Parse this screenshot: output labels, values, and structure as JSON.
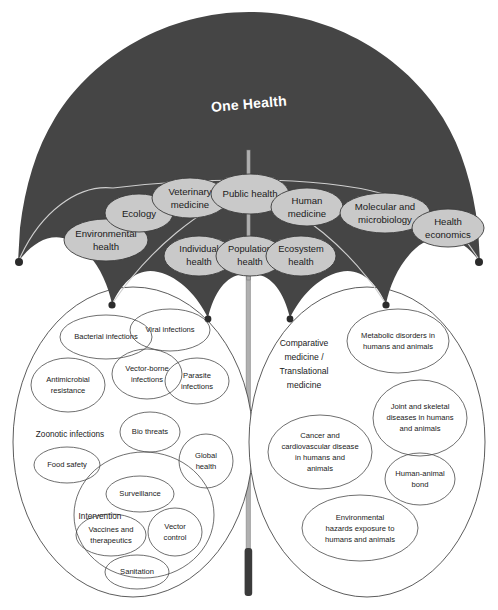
{
  "diagram": {
    "title": "One Health",
    "canopy_color": "#454545",
    "ellipse_color": "#c9c9c9",
    "outline_color": "#4a4a4a"
  },
  "canopy_disciplines": [
    {
      "id": "environmental-health",
      "line1": "Environmental",
      "line2": "health"
    },
    {
      "id": "ecology",
      "line1": "Ecology",
      "line2": ""
    },
    {
      "id": "veterinary-medicine",
      "line1": "Veterinary",
      "line2": "medicine"
    },
    {
      "id": "public-health",
      "line1": "Public health",
      "line2": ""
    },
    {
      "id": "human-medicine",
      "line1": "Human",
      "line2": "medicine"
    },
    {
      "id": "molecular-and-microbiology",
      "line1": "Molecular and",
      "line2": "microbiology"
    },
    {
      "id": "health-economics",
      "line1": "Health",
      "line2": "economics"
    }
  ],
  "core_health_levels": [
    {
      "id": "individual-health",
      "line1": "Individual",
      "line2": "health"
    },
    {
      "id": "population-health",
      "line1": "Population",
      "line2": "health"
    },
    {
      "id": "ecosystem-health",
      "line1": "Ecosystem",
      "line2": "health"
    }
  ],
  "left_cluster": {
    "free_labels": [
      {
        "id": "zoonotic-infections",
        "text": "Zoonotic infections"
      },
      {
        "id": "intervention",
        "text": "Intervention"
      }
    ],
    "bubbles": [
      {
        "id": "bacterial-infections",
        "line1": "Bacterial infections",
        "line2": "",
        "line3": ""
      },
      {
        "id": "viral-infections",
        "line1": "Viral infections",
        "line2": "",
        "line3": ""
      },
      {
        "id": "vector-borne-infections",
        "line1": "Vector-borne",
        "line2": "infections",
        "line3": ""
      },
      {
        "id": "parasite-infections",
        "line1": "Parasite",
        "line2": "infections",
        "line3": ""
      },
      {
        "id": "antimicrobial-resistance",
        "line1": "Antimicrobial",
        "line2": "resistance",
        "line3": ""
      },
      {
        "id": "bio-threats",
        "line1": "Bio threats",
        "line2": "",
        "line3": ""
      },
      {
        "id": "global-health",
        "line1": "Global",
        "line2": "health",
        "line3": ""
      },
      {
        "id": "food-safety",
        "line1": "Food safety",
        "line2": "",
        "line3": ""
      },
      {
        "id": "surveillance",
        "line1": "Surveillance",
        "line2": "",
        "line3": ""
      },
      {
        "id": "vaccines-and-therapeutics",
        "line1": "Vaccines and",
        "line2": "therapeutics",
        "line3": ""
      },
      {
        "id": "vector-control",
        "line1": "Vector",
        "line2": "control",
        "line3": ""
      },
      {
        "id": "sanitation",
        "line1": "Sanitation",
        "line2": "",
        "line3": ""
      }
    ]
  },
  "right_cluster": {
    "free_labels": [
      {
        "id": "comparative-translational-medicine-l1",
        "text": "Comparative"
      },
      {
        "id": "comparative-translational-medicine-l2",
        "text": "medicine /"
      },
      {
        "id": "comparative-translational-medicine-l3",
        "text": "Translational"
      },
      {
        "id": "comparative-translational-medicine-l4",
        "text": "medicine"
      }
    ],
    "bubbles": [
      {
        "id": "metabolic-disorders",
        "line1": "Metabolic disorders in",
        "line2": "humans and animals",
        "line3": "",
        "line4": ""
      },
      {
        "id": "joint-and-skeletal-diseases",
        "line1": "Joint and skeletal",
        "line2": "diseases in humans",
        "line3": "and animals",
        "line4": ""
      },
      {
        "id": "cancer-and-cardiovascular-disease",
        "line1": "Cancer and",
        "line2": "cardiovascular disease",
        "line3": "in humans and",
        "line4": "animals"
      },
      {
        "id": "human-animal-bond",
        "line1": "Human-animal",
        "line2": "bond",
        "line3": "",
        "line4": ""
      },
      {
        "id": "environmental-hazards-exposure",
        "line1": "Environmental",
        "line2": "hazards exposure to",
        "line3": "humans and animals",
        "line4": ""
      }
    ]
  }
}
